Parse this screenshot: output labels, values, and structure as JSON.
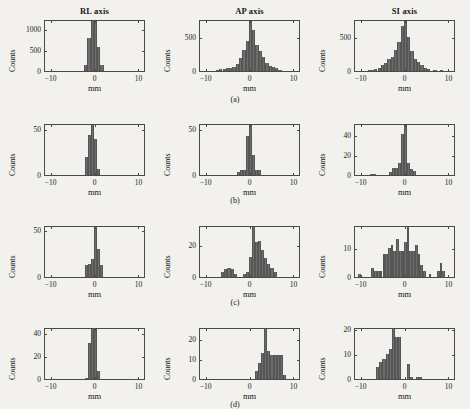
{
  "figure": {
    "column_titles": [
      "RL axis",
      "AP axis",
      "SI axis"
    ],
    "row_labels": [
      "(a)",
      "(b)",
      "(c)",
      "(d)"
    ],
    "x_axis_title": "mm",
    "y_axis_title": "Counts",
    "bar_color": "#6d6d6d",
    "axis_color": "#4a4a4a",
    "background_color": "#f2f1ee"
  },
  "chart_data": [
    {
      "type": "bar",
      "title": "RL axis",
      "panel": "a",
      "xlabel": "mm",
      "ylabel": "Counts",
      "xlim": [
        -11.5,
        11.5
      ],
      "ylim": [
        0,
        1250
      ],
      "xticks": [
        -10,
        0,
        10
      ],
      "xticklabels": [
        "-10",
        "0",
        "10"
      ],
      "yticks": [
        0,
        500,
        1000
      ],
      "yticklabels": [
        "0",
        "500",
        "1000"
      ],
      "grid": false,
      "bin_width": 0.75,
      "x": [
        -2.25,
        -1.5,
        -0.75,
        0,
        0.75,
        1.5
      ],
      "values": [
        150,
        800,
        1250,
        1250,
        570,
        150
      ]
    },
    {
      "type": "bar",
      "title": "AP axis",
      "panel": "a",
      "xlabel": "mm",
      "ylabel": "Counts",
      "xlim": [
        -11.5,
        11.5
      ],
      "ylim": [
        0,
        760
      ],
      "xticks": [
        -10,
        0,
        10
      ],
      "xticklabels": [
        "-10",
        "0",
        "10"
      ],
      "yticks": [
        0,
        500
      ],
      "yticklabels": [
        "0",
        "500"
      ],
      "grid": false,
      "bin_width": 0.75,
      "x": [
        -7.5,
        -6.75,
        -6,
        -5.25,
        -4.5,
        -3.75,
        -3,
        -2.25,
        -1.5,
        -0.75,
        0,
        0.75,
        1.5,
        2.25,
        3,
        3.75,
        4.5,
        5.25,
        6,
        6.75
      ],
      "values": [
        18,
        25,
        30,
        45,
        50,
        60,
        100,
        190,
        300,
        440,
        760,
        600,
        380,
        290,
        200,
        120,
        80,
        55,
        45,
        20
      ]
    },
    {
      "type": "bar",
      "title": "SI axis",
      "panel": "a",
      "xlabel": "mm",
      "ylabel": "Counts",
      "xlim": [
        -11.5,
        11.5
      ],
      "ylim": [
        0,
        760
      ],
      "xticks": [
        -10,
        0,
        10
      ],
      "xticklabels": [
        "-10",
        "0",
        "10"
      ],
      "yticks": [
        0,
        500
      ],
      "yticklabels": [
        "0",
        "500"
      ],
      "grid": false,
      "bin_width": 0.75,
      "x": [
        -8.25,
        -7.5,
        -6.75,
        -6,
        -5.25,
        -4.5,
        -3.75,
        -3,
        -2.25,
        -1.5,
        -0.75,
        0,
        0.75,
        1.5,
        2.25,
        3,
        3.75,
        4.5,
        5.25,
        6.75,
        8.25
      ],
      "values": [
        12,
        20,
        30,
        45,
        90,
        120,
        170,
        210,
        300,
        420,
        660,
        760,
        490,
        290,
        180,
        130,
        90,
        50,
        25,
        18,
        15
      ]
    },
    {
      "type": "bar",
      "title": "RL axis",
      "panel": "b",
      "xlabel": "mm",
      "ylabel": "Counts",
      "xlim": [
        -11.5,
        11.5
      ],
      "ylim": [
        0,
        57
      ],
      "xticks": [
        -10,
        0,
        10
      ],
      "xticklabels": [
        "-10",
        "0",
        "10"
      ],
      "yticks": [
        0,
        50
      ],
      "yticklabels": [
        "0",
        "50"
      ],
      "grid": false,
      "bin_width": 0.7,
      "x": [
        -2.1,
        -1.4,
        -0.7,
        0,
        0.7
      ],
      "values": [
        20,
        44,
        57,
        40,
        7
      ]
    },
    {
      "type": "bar",
      "title": "AP axis",
      "panel": "b",
      "xlabel": "mm",
      "ylabel": "Counts",
      "xlim": [
        -11.5,
        11.5
      ],
      "ylim": [
        0,
        57
      ],
      "xticks": [
        -10,
        0,
        10
      ],
      "xticklabels": [
        "-10",
        "0",
        "10"
      ],
      "yticks": [
        0,
        50
      ],
      "yticklabels": [
        "0",
        "50"
      ],
      "grid": false,
      "bin_width": 0.7,
      "x": [
        -2.8,
        -2.1,
        -1.4,
        -0.7,
        0,
        0.7,
        1.4,
        2.1
      ],
      "values": [
        3,
        5,
        6,
        43,
        57,
        22,
        6,
        5
      ]
    },
    {
      "type": "bar",
      "title": "SI axis",
      "panel": "b",
      "xlabel": "mm",
      "ylabel": "Counts",
      "xlim": [
        -11.5,
        11.5
      ],
      "ylim": [
        0,
        52
      ],
      "xticks": [
        -10,
        0,
        10
      ],
      "xticklabels": [
        "-10",
        "0",
        "10"
      ],
      "yticks": [
        0,
        20,
        40
      ],
      "yticklabels": [
        "0",
        "20",
        "40"
      ],
      "grid": false,
      "bin_width": 0.7,
      "x": [
        -7.7,
        -7,
        -3.5,
        -2.8,
        -2.1,
        -1.4,
        -0.7,
        0,
        0.7,
        1.4,
        2.1
      ],
      "values": [
        1,
        1,
        3,
        7,
        7,
        12,
        41,
        52,
        12,
        6,
        4
      ]
    },
    {
      "type": "bar",
      "title": "RL axis",
      "panel": "c",
      "xlabel": "mm",
      "ylabel": "Counts",
      "xlim": [
        -11.5,
        11.5
      ],
      "ylim": [
        0,
        55
      ],
      "xticks": [
        -10,
        0,
        10
      ],
      "xticklabels": [
        "-10",
        "0",
        "10"
      ],
      "yticks": [
        0,
        50
      ],
      "yticklabels": [
        "0",
        "50"
      ],
      "grid": false,
      "bin_width": 0.7,
      "x": [
        -2.1,
        -1.4,
        -0.7,
        0,
        0.7,
        1.4
      ],
      "values": [
        13,
        14,
        19,
        55,
        30,
        13
      ]
    },
    {
      "type": "bar",
      "title": "AP axis",
      "panel": "c",
      "xlabel": "mm",
      "ylabel": "Counts",
      "xlim": [
        -11.5,
        11.5
      ],
      "ylim": [
        0,
        33
      ],
      "xticks": [
        -10,
        0,
        10
      ],
      "xticklabels": [
        "-10",
        "0",
        "10"
      ],
      "yticks": [
        0,
        20
      ],
      "yticklabels": [
        "0",
        "20"
      ],
      "grid": false,
      "bin_width": 0.7,
      "x": [
        -6.3,
        -5.6,
        -4.9,
        -4.2,
        -3.5,
        -1.4,
        -0.7,
        0,
        0.7,
        1.4,
        2.1,
        2.8,
        3.5,
        4.2,
        4.9,
        5.6
      ],
      "values": [
        3,
        5,
        6,
        5,
        2,
        2,
        3,
        13,
        33,
        22,
        23,
        17,
        12,
        8,
        6,
        3
      ]
    },
    {
      "type": "bar",
      "title": "SI axis",
      "panel": "c",
      "xlabel": "mm",
      "ylabel": "Counts",
      "xlim": [
        -11.5,
        11.5
      ],
      "ylim": [
        0,
        18
      ],
      "xticks": [
        -10,
        0,
        10
      ],
      "xticklabels": [
        "-10",
        "0",
        "10"
      ],
      "yticks": [
        0,
        10
      ],
      "yticklabels": [
        "0",
        "10"
      ],
      "grid": false,
      "bin_width": 0.62,
      "x": [
        -10.5,
        -7.5,
        -6.9,
        -6.2,
        -5.6,
        -4.9,
        -4.3,
        -3.7,
        -3.1,
        -2.5,
        -1.9,
        -1.2,
        -0.6,
        0,
        0.6,
        1.2,
        1.9,
        2.5,
        3.1,
        3.7,
        4.3,
        5.6,
        7.5,
        8.1,
        8.7
      ],
      "values": [
        1,
        3,
        2,
        2,
        2,
        8,
        8,
        10,
        11,
        9,
        13,
        9,
        9,
        12,
        18,
        9,
        9,
        11,
        8,
        4,
        2,
        1,
        2,
        5,
        2
      ]
    },
    {
      "type": "bar",
      "title": "RL axis",
      "panel": "d",
      "xlabel": "mm",
      "ylabel": "Counts",
      "xlim": [
        -11.5,
        11.5
      ],
      "ylim": [
        0,
        45
      ],
      "xticks": [
        -10,
        0,
        10
      ],
      "xticklabels": [
        "-10",
        "0",
        "10"
      ],
      "yticks": [
        0,
        20,
        40
      ],
      "yticklabels": [
        "0",
        "20",
        "40"
      ],
      "grid": false,
      "bin_width": 0.7,
      "x": [
        -2.1,
        -1.4,
        -0.7,
        0,
        0.7
      ],
      "values": [
        1,
        31,
        45,
        45,
        7
      ]
    },
    {
      "type": "bar",
      "title": "AP axis",
      "panel": "d",
      "xlabel": "mm",
      "ylabel": "Counts",
      "xlim": [
        -11.5,
        11.5
      ],
      "ylim": [
        0,
        26
      ],
      "xticks": [
        -10,
        0,
        10
      ],
      "xticklabels": [
        "-10",
        "0",
        "10"
      ],
      "yticks": [
        0,
        10,
        20
      ],
      "yticklabels": [
        "0",
        "10",
        "20"
      ],
      "grid": false,
      "bin_width": 0.7,
      "x": [
        1.4,
        2.1,
        2.8,
        3.5,
        4.2,
        4.9,
        5.6,
        6.3,
        7,
        7.7
      ],
      "values": [
        4,
        8,
        13,
        26,
        14,
        12,
        12,
        12,
        12,
        2
      ]
    },
    {
      "type": "bar",
      "title": "SI axis",
      "panel": "d",
      "xlabel": "mm",
      "ylabel": "Counts",
      "xlim": [
        -11.5,
        11.5
      ],
      "ylim": [
        0,
        21
      ],
      "xticks": [
        -10,
        0,
        10
      ],
      "xticklabels": [
        "-10",
        "0",
        "10"
      ],
      "yticks": [
        0,
        10,
        20
      ],
      "yticklabels": [
        "0",
        "10",
        "20"
      ],
      "grid": false,
      "bin_width": 0.7,
      "x": [
        -6.3,
        -5.6,
        -4.9,
        -4.2,
        -3.5,
        -2.8,
        -2.1,
        -1.4,
        0.7,
        1.4,
        2.8,
        3.5
      ],
      "values": [
        5,
        7,
        8,
        10,
        12,
        21,
        17,
        17,
        6,
        1,
        1,
        1
      ]
    }
  ]
}
